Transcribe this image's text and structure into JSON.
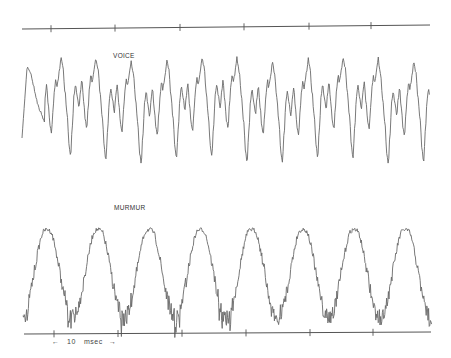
{
  "figure": {
    "background": "#ffffff",
    "trace_color": "#6a6a6a",
    "axis_color": "#555555"
  },
  "labels": {
    "voice": "VOICE",
    "murmur": "MURMUR",
    "scale_value": "10",
    "scale_unit": "msec",
    "scale_left_arrow": "←",
    "scale_right_arrow": "→"
  },
  "chart_data": [
    {
      "type": "line",
      "title": "VOICE",
      "xlabel": "time",
      "ylabel": "amplitude",
      "description": "Periodic speech waveform with sharp downward troughs and multiple sub-peaks per cycle",
      "time_scale_ms_per_tick": 10,
      "px_range": [
        22,
        430
      ],
      "period_px": 35.3,
      "cycles_visible": 11,
      "fundamental_period_ms": 5.5,
      "y_range_px": [
        55,
        170
      ],
      "grid": false,
      "start_px": [
        22,
        138
      ],
      "end_px": [
        430,
        95
      ]
    },
    {
      "type": "line",
      "title": "MURMUR",
      "xlabel": "time",
      "ylabel": "amplitude",
      "description": "Quasi-sinusoidal low-frequency wave with superimposed high-frequency noise",
      "time_scale_ms_per_tick": 10,
      "px_range": [
        23,
        432
      ],
      "period_px": 51.2,
      "cycles_visible": 8,
      "fundamental_period_ms": 8,
      "peak_x_px": [
        47,
        96,
        146,
        196,
        248,
        300,
        351,
        404
      ],
      "y_range_px": [
        222,
        325
      ],
      "grid": false
    }
  ],
  "axes": {
    "top": {
      "x1": 22,
      "y1": 29,
      "x2": 430,
      "y2": 25,
      "ticks_x": [
        51,
        115,
        180,
        244,
        309,
        371
      ]
    },
    "bottom": {
      "x1": 24,
      "y1": 334,
      "x2": 431,
      "y2": 332,
      "ticks_x": [
        54,
        118,
        182,
        246,
        310,
        373
      ]
    },
    "scale_bar": {
      "from_x": 54,
      "to_x": 118,
      "y": 340
    }
  }
}
